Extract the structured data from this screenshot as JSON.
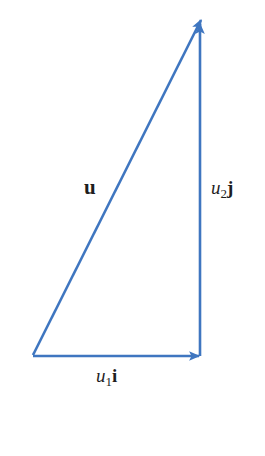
{
  "figure": {
    "type": "vector-decomposition-diagram",
    "labels": {
      "hypotenuse": {
        "text": "u"
      },
      "vertical": {
        "var": "u",
        "sub": "2",
        "unit": "j"
      },
      "horizontal": {
        "var": "u",
        "sub": "1",
        "unit": "i"
      }
    },
    "colors": {
      "vector_blue": "#3f76c0",
      "label_black": "#1e1e1e"
    }
  },
  "caption": {
    "marker": "blue-triangle",
    "figure_char": "圖",
    "number": "1"
  }
}
